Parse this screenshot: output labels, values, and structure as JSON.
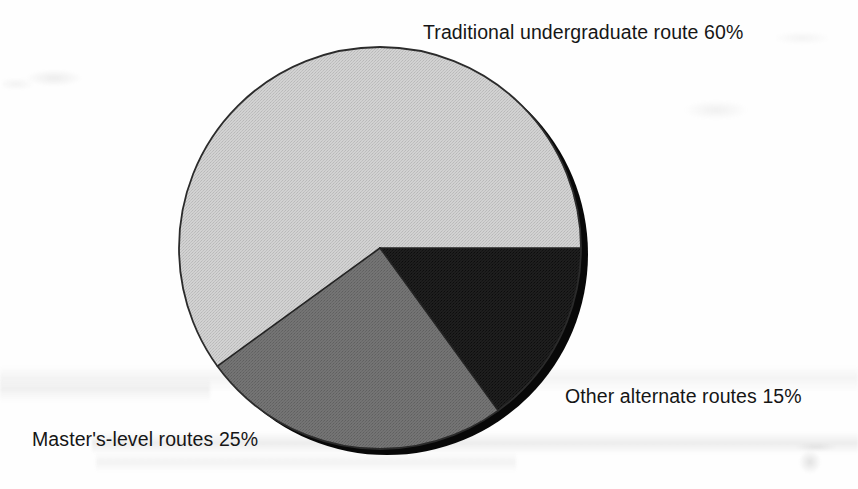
{
  "figure": {
    "kind": "pie-chart",
    "background_color": "#ffffff"
  },
  "labels": {
    "traditional": "Traditional undergraduate route 60%",
    "other": "Other alternate routes 15%",
    "masters": "Master's-level routes 25%"
  },
  "chart_data": {
    "type": "pie",
    "title": "",
    "subtitle": "",
    "xlabel": "",
    "ylabel": "",
    "grid": false,
    "legend_position": "none",
    "label_style": "outside-callout-free",
    "units": "percent",
    "total": 100,
    "start_angle_deg": 0,
    "direction": "counterclockwise",
    "three_d": true,
    "categories": [
      "Traditional undergraduate route",
      "Master's-level routes",
      "Other alternate routes"
    ],
    "values": [
      60,
      25,
      15
    ],
    "slices": [
      {
        "label": "Traditional undergraduate route",
        "value": 60,
        "value_text": "60%",
        "label_text": "Traditional undergraduate route 60%",
        "color": "#c9c9c9",
        "sweep_deg": 216,
        "start_deg": 0,
        "end_deg": 216,
        "label_position": "top-right"
      },
      {
        "label": "Master's-level routes",
        "value": 25,
        "value_text": "25%",
        "label_text": "Master's-level routes 25%",
        "color": "#6e6e6e",
        "sweep_deg": 90,
        "start_deg": 216,
        "end_deg": 306,
        "label_position": "bottom-left"
      },
      {
        "label": "Other alternate routes",
        "value": 15,
        "value_text": "15%",
        "label_text": "Other alternate routes 15%",
        "color": "#1c1c1c",
        "sweep_deg": 54,
        "start_deg": 306,
        "end_deg": 360,
        "label_position": "bottom-right"
      }
    ],
    "colors": [
      "#c9c9c9",
      "#6e6e6e",
      "#1c1c1c"
    ],
    "edge_color": "#2a2a2a",
    "depth_color": "#0d0d0d"
  }
}
